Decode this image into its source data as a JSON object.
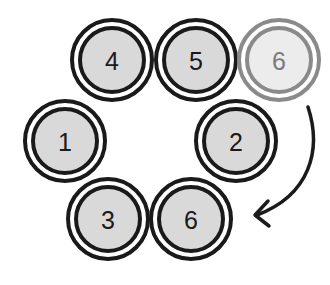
{
  "diagram": {
    "colors": {
      "fill": "#d9d9d9",
      "stroke": "#1a1a1a",
      "faded_fill": "#ececec",
      "faded_stroke": "#8a8a8a",
      "faded_text": "#7a7a7a",
      "text": "#1a1a1a",
      "arrow": "#1a1a1a"
    },
    "circles": [
      {
        "label": "4",
        "cx": 112,
        "cy": 60,
        "faded": false
      },
      {
        "label": "5",
        "cx": 196,
        "cy": 60,
        "faded": false
      },
      {
        "label": "6",
        "cx": 279,
        "cy": 60,
        "faded": true
      },
      {
        "label": "1",
        "cx": 65,
        "cy": 141,
        "faded": false
      },
      {
        "label": "2",
        "cx": 236,
        "cy": 141,
        "faded": false
      },
      {
        "label": "3",
        "cx": 108,
        "cy": 219,
        "faded": false
      },
      {
        "label": "6",
        "cx": 191,
        "cy": 219,
        "faded": false
      }
    ],
    "arrow": {
      "from_label": "6 (faded, top right)",
      "to_label": "6 (bottom)",
      "direction": "clockwise curve downward"
    }
  }
}
